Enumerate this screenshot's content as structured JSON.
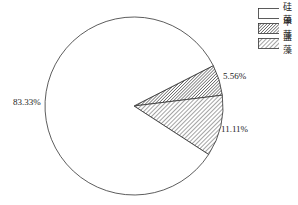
{
  "chart_data": {
    "type": "pie",
    "title": "",
    "categories": [
      "硅藻",
      "甲藻",
      "蓝藻"
    ],
    "values": [
      83.33,
      5.56,
      11.11
    ],
    "labels": [
      "83.33%",
      "5.56%",
      "11.11%"
    ],
    "fills": [
      "white",
      "dense-hatch",
      "sparse-hatch"
    ],
    "legend_position": "top-right",
    "start_angle_deg": -27
  },
  "legend": {
    "items": [
      {
        "label": "硅藻",
        "pattern": "white"
      },
      {
        "label": "甲藻",
        "pattern": "dense-hatch"
      },
      {
        "label": "蓝藻",
        "pattern": "sparse-hatch"
      }
    ]
  },
  "slice_labels": {
    "guizao": "83.33%",
    "jiazao": "5.56%",
    "lanzao": "11.11%"
  },
  "colors": {
    "stroke": "#333333",
    "background": "#ffffff"
  }
}
